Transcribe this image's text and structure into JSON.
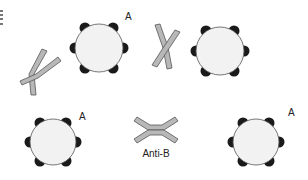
{
  "diagram": {
    "title": "",
    "colors": {
      "cell_fill": "#f2f2f2",
      "cell_stroke": "#555555",
      "antigen": "#1a1a1a",
      "antibody_fill": "#b8b8b8",
      "antibody_stroke": "#555555",
      "background": "#ffffff"
    },
    "cells": [
      {
        "id": "cell-top-left",
        "cx": 99,
        "cy": 48,
        "r": 24,
        "label": "A",
        "label_x": 125,
        "label_y": 20
      },
      {
        "id": "cell-top-right",
        "cx": 220,
        "cy": 51,
        "r": 24,
        "label": "",
        "label_x": 0,
        "label_y": 0
      },
      {
        "id": "cell-bottom-left",
        "cx": 53,
        "cy": 142,
        "r": 23,
        "label": "A",
        "label_x": 79,
        "label_y": 120
      },
      {
        "id": "cell-bottom-right",
        "cx": 256,
        "cy": 142,
        "r": 23,
        "label": "A",
        "label_x": 288,
        "label_y": 116
      }
    ],
    "antibodies": [
      {
        "id": "antibody-top-left",
        "label": ""
      },
      {
        "id": "antibody-top-middle",
        "label": ""
      },
      {
        "id": "antibody-bottom-middle",
        "label": "Anti-B"
      }
    ],
    "edge_text_fragment": "(cut-off text at left edge)"
  }
}
